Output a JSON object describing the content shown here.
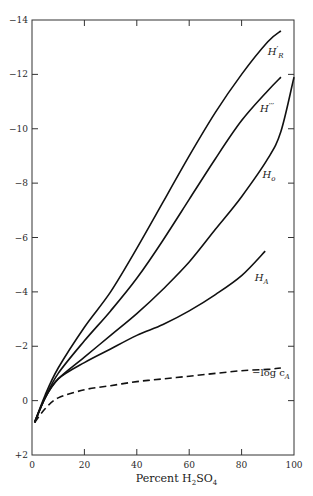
{
  "chart_data": {
    "type": "line",
    "title": "",
    "xlabel": "Percent H2SO4",
    "ylabel": "",
    "xlim": [
      0,
      100
    ],
    "ylim": [
      2,
      -14
    ],
    "y_axis_inverted": true,
    "grid": false,
    "x_ticks": [
      0,
      20,
      40,
      60,
      80,
      100
    ],
    "x_tick_labels": [
      "0",
      "20",
      "40",
      "60",
      "80",
      "100"
    ],
    "y_ticks": [
      -14,
      -12,
      -10,
      -8,
      -6,
      -4,
      -2,
      0,
      2
    ],
    "y_tick_labels": [
      "-14",
      "-12",
      "-10",
      "-8",
      "-6",
      "-4",
      "-2",
      "0",
      "+2"
    ],
    "series": [
      {
        "name": "H_R'",
        "label": "H'R",
        "style": "solid",
        "x": [
          1,
          5,
          10,
          20,
          30,
          40,
          50,
          60,
          70,
          80,
          90,
          95
        ],
        "y": [
          0.8,
          -0.2,
          -1.2,
          -2.7,
          -4.0,
          -5.6,
          -7.3,
          -9.0,
          -10.6,
          -12.0,
          -13.2,
          -13.6
        ]
      },
      {
        "name": "H'''",
        "label": "H'''",
        "style": "solid",
        "x": [
          1,
          5,
          10,
          20,
          30,
          40,
          50,
          60,
          70,
          80,
          90,
          95
        ],
        "y": [
          0.8,
          -0.1,
          -1.0,
          -2.2,
          -3.3,
          -4.5,
          -5.9,
          -7.4,
          -8.9,
          -10.3,
          -11.4,
          -11.9
        ]
      },
      {
        "name": "H_0",
        "label": "Ho",
        "style": "solid",
        "x": [
          1,
          5,
          10,
          20,
          30,
          40,
          50,
          60,
          70,
          80,
          90,
          95,
          100
        ],
        "y": [
          0.8,
          -0.1,
          -0.8,
          -1.6,
          -2.4,
          -3.2,
          -4.1,
          -5.1,
          -6.3,
          -7.5,
          -8.9,
          -9.9,
          -11.9
        ]
      },
      {
        "name": "H_A",
        "label": "HA",
        "style": "solid",
        "x": [
          1,
          5,
          10,
          20,
          30,
          40,
          50,
          60,
          70,
          80,
          89
        ],
        "y": [
          0.8,
          -0.1,
          -0.8,
          -1.4,
          -1.9,
          -2.4,
          -2.8,
          -3.3,
          -3.9,
          -4.6,
          -5.5
        ]
      },
      {
        "name": "-log c_A",
        "label": "−log cA",
        "style": "dashed",
        "x": [
          1,
          5,
          10,
          20,
          30,
          40,
          50,
          60,
          70,
          80,
          90,
          95
        ],
        "y": [
          0.8,
          0.3,
          -0.1,
          -0.4,
          -0.55,
          -0.7,
          -0.8,
          -0.9,
          -1.0,
          -1.1,
          -1.15,
          -1.2
        ]
      }
    ],
    "annotations": [
      {
        "text": "H'R",
        "x": 90,
        "y": -12.7
      },
      {
        "text": "H'''",
        "x": 87,
        "y": -10.6
      },
      {
        "text": "Ho",
        "x": 88,
        "y": -8.2
      },
      {
        "text": "HA",
        "x": 85,
        "y": -4.4
      },
      {
        "text": "−log cA",
        "x": 84,
        "y": -0.9
      }
    ]
  },
  "labels": {
    "xlabel_prefix": "Percent H",
    "xlabel_sub1": "2",
    "xlabel_mid": "SO",
    "xlabel_sub2": "4"
  }
}
